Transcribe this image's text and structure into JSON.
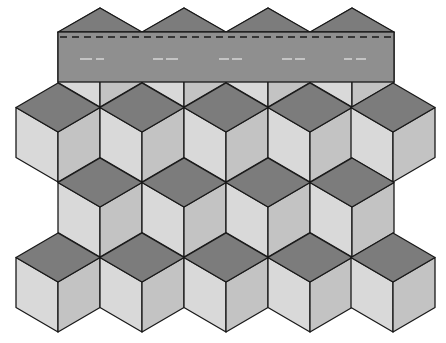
{
  "figure": {
    "width": 446,
    "height": 343
  },
  "colors": {
    "background": "#ffffff",
    "top_face": "#7c7c7c",
    "left_face": "#d9d9d9",
    "right_face": "#c3c3c3",
    "banner": "#8f8f8f",
    "roof": "#7c7c7c",
    "stroke": "#1a1a1a",
    "marks": "#d6d6d6"
  },
  "geometry": {
    "half_width": 42,
    "rhombus_half_height": 24.5,
    "side_height": 50,
    "row_step": 75
  },
  "banner": {
    "x": 58,
    "y": 32,
    "width": 336,
    "height": 50,
    "dash_y": 37,
    "roof_apexes": [
      {
        "x": 100,
        "y": 8
      },
      {
        "x": 184,
        "y": 8
      },
      {
        "x": 268,
        "y": 8
      },
      {
        "x": 352,
        "y": 8
      }
    ],
    "marks": [
      {
        "x1": 80,
        "x2": 92
      },
      {
        "x1": 96,
        "x2": 104
      },
      {
        "x1": 153,
        "x2": 163
      },
      {
        "x1": 166,
        "x2": 178
      },
      {
        "x1": 219,
        "x2": 229
      },
      {
        "x1": 232,
        "x2": 242
      },
      {
        "x1": 282,
        "x2": 292
      },
      {
        "x1": 295,
        "x2": 305
      },
      {
        "x1": 344,
        "x2": 352
      },
      {
        "x1": 356,
        "x2": 366
      }
    ],
    "marks_y": 59
  },
  "cubes": {
    "row0_partial": [
      100,
      184,
      268,
      352
    ],
    "rows": [
      {
        "top_y": 83,
        "centers": [
          58,
          142,
          226,
          310,
          393
        ]
      },
      {
        "top_y": 158,
        "centers": [
          100,
          184,
          268,
          352
        ]
      },
      {
        "top_y": 233,
        "centers": [
          58,
          142,
          226,
          310,
          393
        ]
      }
    ]
  }
}
